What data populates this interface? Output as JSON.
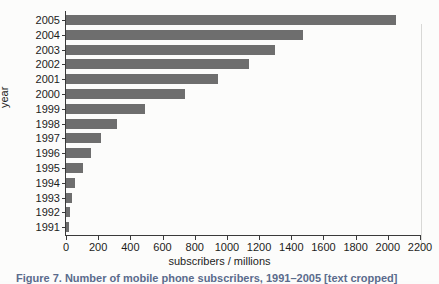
{
  "chart_data": {
    "type": "bar",
    "orientation": "horizontal",
    "title": "",
    "xlabel": "subscribers / millions",
    "ylabel": "year",
    "xlim": [
      0,
      2200
    ],
    "ylim": [
      1991,
      2005
    ],
    "grid": false,
    "legend": null,
    "bar_color": "#6e6e6e",
    "xticks": [
      0,
      200,
      400,
      600,
      800,
      1000,
      1200,
      1400,
      1600,
      1800,
      2000,
      2200
    ],
    "xticklabels": [
      "0",
      "200",
      "400",
      "600",
      "800",
      "1000",
      "1200",
      "1400",
      "1600",
      "1800",
      "2000",
      "2200"
    ],
    "categories": [
      "2005",
      "2004",
      "2003",
      "2002",
      "2001",
      "2000",
      "1999",
      "1998",
      "1997",
      "1996",
      "1995",
      "1994",
      "1993",
      "1992",
      "1991"
    ],
    "values": [
      2050,
      1470,
      1300,
      1135,
      945,
      740,
      490,
      320,
      215,
      155,
      105,
      55,
      35,
      23,
      16
    ]
  },
  "figure": {
    "caption": "Figure 7. Number of mobile phone subscribers, 1991–2005 [text cropped]"
  }
}
